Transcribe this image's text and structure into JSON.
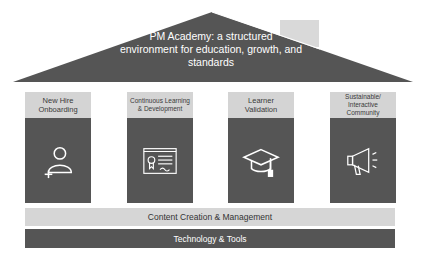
{
  "roof": {
    "title_line1": "PM Academy: a structured",
    "title_line2": "environment for education, growth, and",
    "title_line3": "standards"
  },
  "pillars": [
    {
      "label": "New Hire Onboarding",
      "icon": "add-user-icon"
    },
    {
      "label": "Continuous Learning & Development",
      "icon": "certificate-icon"
    },
    {
      "label": "Learner Validation",
      "icon": "graduation-cap-icon"
    },
    {
      "label": "Sustainable/ Interactive Community",
      "icon": "megaphone-icon"
    }
  ],
  "foundation": {
    "content_bar": "Content Creation & Management",
    "tech_bar": "Technology & Tools"
  },
  "colors": {
    "dark": "#555555",
    "light": "#d4d4d4",
    "chimney": "#d9d9d9"
  }
}
